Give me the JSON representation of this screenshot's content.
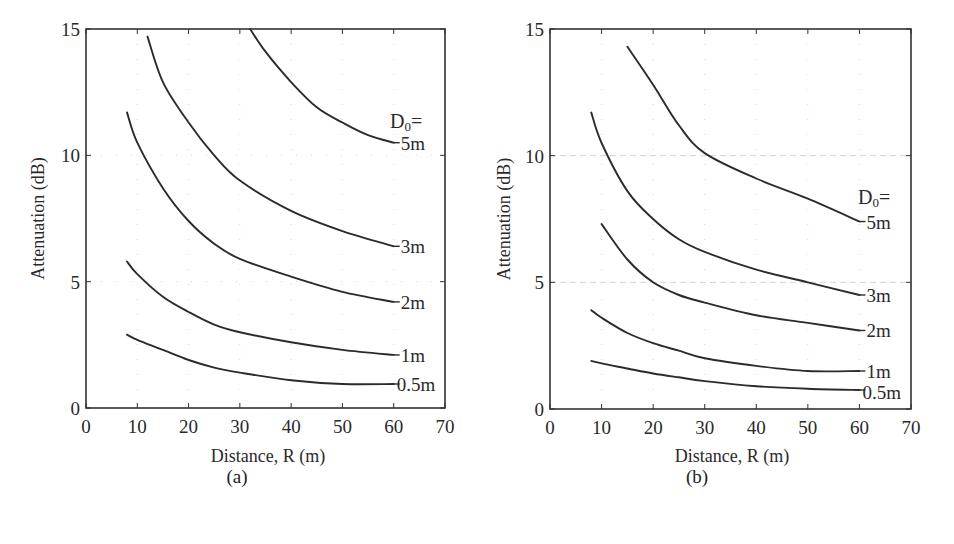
{
  "figure": {
    "panels": [
      {
        "caption": "(a)",
        "ylabel": "Attenuation (dB)",
        "xlabel": "Distance, R (m)",
        "legend_title": "D₀="
      },
      {
        "caption": "(b)",
        "ylabel": "Attenuation (dB)",
        "xlabel": "Distance, R (m)",
        "legend_title": "D₀="
      }
    ]
  },
  "chart_data": [
    {
      "type": "line",
      "title": "(a)",
      "xlabel": "Distance, R (m)",
      "ylabel": "Attenuation (dB)",
      "xlim": [
        0,
        70
      ],
      "ylim": [
        0,
        15
      ],
      "xticks": [
        0,
        10,
        20,
        30,
        40,
        50,
        60,
        70
      ],
      "yticks": [
        0,
        5,
        10,
        15
      ],
      "grid": "faint dotted at major ticks",
      "legend_title": "D₀=",
      "legend_position": "right end of each curve",
      "series": [
        {
          "name": "5m",
          "x": [
            32,
            35,
            40,
            45,
            50,
            55,
            60
          ],
          "y": [
            15.0,
            14.1,
            12.9,
            11.9,
            11.3,
            10.8,
            10.5
          ]
        },
        {
          "name": "3m",
          "x": [
            12,
            15,
            20,
            25,
            30,
            40,
            50,
            60
          ],
          "y": [
            14.7,
            12.9,
            11.3,
            10.0,
            9.0,
            7.8,
            7.0,
            6.4
          ]
        },
        {
          "name": "2m",
          "x": [
            8,
            10,
            15,
            20,
            25,
            30,
            40,
            50,
            60
          ],
          "y": [
            11.7,
            10.5,
            8.7,
            7.4,
            6.5,
            5.9,
            5.2,
            4.6,
            4.2
          ]
        },
        {
          "name": "1m",
          "x": [
            8,
            10,
            15,
            20,
            25,
            30,
            40,
            50,
            60
          ],
          "y": [
            5.8,
            5.3,
            4.4,
            3.8,
            3.3,
            3.0,
            2.6,
            2.3,
            2.1
          ]
        },
        {
          "name": "0.5m",
          "x": [
            8,
            10,
            15,
            20,
            25,
            30,
            40,
            50,
            60
          ],
          "y": [
            2.9,
            2.7,
            2.3,
            1.9,
            1.6,
            1.4,
            1.1,
            0.95,
            0.95
          ]
        }
      ]
    },
    {
      "type": "line",
      "title": "(b)",
      "xlabel": "Distance, R (m)",
      "ylabel": "Attenuation (dB)",
      "xlim": [
        0,
        70
      ],
      "ylim": [
        0,
        15
      ],
      "xticks": [
        0,
        10,
        20,
        30,
        40,
        50,
        60,
        70
      ],
      "yticks": [
        0,
        5,
        10,
        15
      ],
      "grid": "faint dotted at major ticks",
      "legend_title": "D₀=",
      "legend_position": "right end of each curve",
      "series": [
        {
          "name": "5m",
          "x": [
            15,
            20,
            25,
            30,
            40,
            50,
            60
          ],
          "y": [
            14.3,
            12.8,
            11.2,
            10.1,
            9.1,
            8.3,
            7.4
          ]
        },
        {
          "name": "3m",
          "x": [
            8,
            10,
            15,
            20,
            25,
            30,
            40,
            50,
            60
          ],
          "y": [
            11.7,
            10.5,
            8.6,
            7.5,
            6.7,
            6.2,
            5.5,
            5.0,
            4.5
          ]
        },
        {
          "name": "2m",
          "x": [
            10,
            15,
            20,
            25,
            30,
            40,
            50,
            60
          ],
          "y": [
            7.3,
            5.9,
            5.0,
            4.5,
            4.2,
            3.7,
            3.4,
            3.1
          ]
        },
        {
          "name": "1m",
          "x": [
            8,
            10,
            15,
            20,
            25,
            30,
            40,
            50,
            60
          ],
          "y": [
            3.9,
            3.6,
            3.0,
            2.6,
            2.3,
            2.0,
            1.7,
            1.5,
            1.5
          ]
        },
        {
          "name": "0.5m",
          "x": [
            8,
            10,
            15,
            20,
            25,
            30,
            40,
            50,
            60
          ],
          "y": [
            1.9,
            1.8,
            1.6,
            1.4,
            1.25,
            1.1,
            0.9,
            0.8,
            0.75
          ]
        }
      ]
    }
  ]
}
